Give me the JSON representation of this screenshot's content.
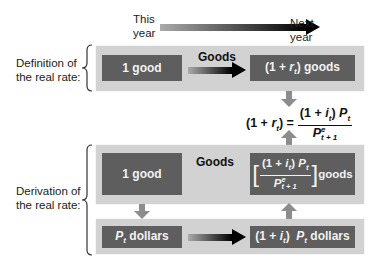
{
  "timeline": {
    "left_label": "This year",
    "left_line1": "This",
    "left_line2": "year",
    "right_line1": "Next",
    "right_line2": "year"
  },
  "definition": {
    "side_label_line1": "Definition of",
    "side_label_line2": "the real rate:",
    "left_box": "1 good",
    "arrow_label": "Goods",
    "right_box_prefix": "(1 + ",
    "right_box_var": "r",
    "right_box_sub": "t",
    "right_box_suffix": ") goods"
  },
  "equation": {
    "lhs_prefix": "(1 + ",
    "lhs_var": "r",
    "lhs_sub": "t",
    "lhs_suffix": ") =",
    "num_prefix": "(1 + ",
    "num_var": "i",
    "num_sub": "t",
    "num_mid": ") ",
    "num_P": "P",
    "num_P_sub": "t",
    "den_P": "P",
    "den_sup": "e",
    "den_sub": "t + 1"
  },
  "derivation": {
    "side_label_line1": "Derivation of",
    "side_label_line2": "the real rate:",
    "top_left_box": "1 good",
    "top_label": "Goods",
    "top_right_num_prefix": "(1 + ",
    "top_right_num_var": "i",
    "top_right_num_sub": "t",
    "top_right_num_mid": ") ",
    "top_right_num_P": "P",
    "top_right_num_P_sub": "t",
    "top_right_den_P": "P",
    "top_right_den_sup": "e",
    "top_right_den_sub": "t + 1",
    "top_right_suffix": "goods",
    "bottom_left_P": "P",
    "bottom_left_sub": "t",
    "bottom_left_suffix": " dollars",
    "bottom_right_prefix": "(1 + ",
    "bottom_right_var": "i",
    "bottom_right_sub": "t",
    "bottom_right_mid": ")  ",
    "bottom_right_P": "P",
    "bottom_right_P_sub": "t",
    "bottom_right_suffix": " dollars"
  },
  "colors": {
    "panel": "#d2d2d2",
    "box": "#5e5e5e",
    "box_text": "#f2f2f2",
    "arrow_dark": "#000000",
    "connector": "#8c8c8c"
  }
}
